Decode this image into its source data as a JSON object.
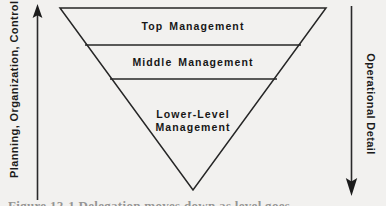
{
  "figure": {
    "type": "inverted-pyramid-diagram",
    "background_color": "#f2f1ef",
    "line_color": "#222222",
    "text_color": "#171717"
  },
  "axes": {
    "left": {
      "label": "Planning, Organization, Control",
      "arrow_direction": "up",
      "icon": "arrow-up-icon"
    },
    "right": {
      "label": "Operational Detail",
      "arrow_direction": "down",
      "icon": "arrow-down-icon"
    }
  },
  "pyramid": {
    "tiers": [
      {
        "id": "top",
        "label": "Top Management"
      },
      {
        "id": "middle",
        "label": "Middle Management"
      },
      {
        "id": "lower",
        "label_line1": "Lower-Level",
        "label_line2": "Management"
      }
    ]
  },
  "caption": {
    "text": "Figure 12-1  Delegation moves down as level goes down"
  }
}
